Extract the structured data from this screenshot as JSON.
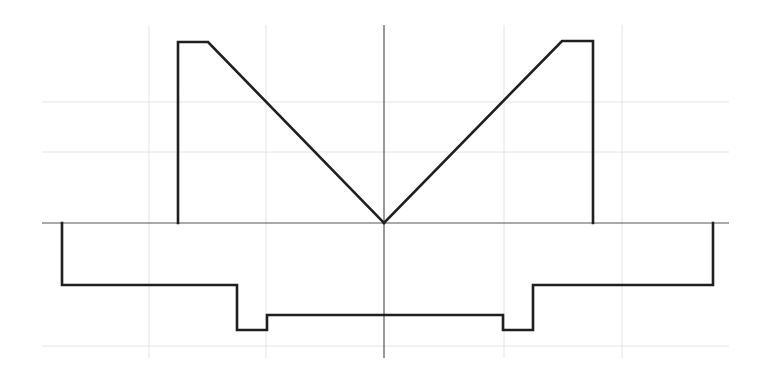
{
  "diagram": {
    "type": "symmetric-cross-section-profile",
    "colors": {
      "background": "#ffffff",
      "profile_stroke": "#1f1f1f",
      "axis_stroke": "#555555",
      "grid_stroke": "#e4e4e4"
    },
    "axes": {
      "vertical_center": {
        "x": 384,
        "y1": 25,
        "y2": 358
      },
      "horizontal_reference": {
        "y": 223,
        "x1": 42,
        "x2": 729
      }
    },
    "grid": {
      "vertical_x": [
        149,
        266,
        504,
        622
      ],
      "horizontal_y": [
        102,
        152,
        346
      ],
      "extent": {
        "x1": 42,
        "x2": 729,
        "y1": 25,
        "y2": 358
      }
    },
    "upper_profile": {
      "left_tower": [
        [
          178,
          223
        ],
        [
          178,
          42
        ],
        [
          208,
          42
        ],
        [
          384,
          223
        ]
      ],
      "right_tower": [
        [
          384,
          223
        ],
        [
          562,
          41
        ],
        [
          593,
          41
        ],
        [
          593,
          223
        ]
      ]
    },
    "lower_profile": {
      "points": [
        [
          62,
          223
        ],
        [
          62,
          285
        ],
        [
          237,
          285
        ],
        [
          237,
          330
        ],
        [
          267,
          330
        ],
        [
          267,
          315
        ],
        [
          503,
          315
        ],
        [
          503,
          330
        ],
        [
          533,
          330
        ],
        [
          533,
          285
        ],
        [
          713,
          285
        ],
        [
          713,
          223
        ]
      ]
    }
  }
}
